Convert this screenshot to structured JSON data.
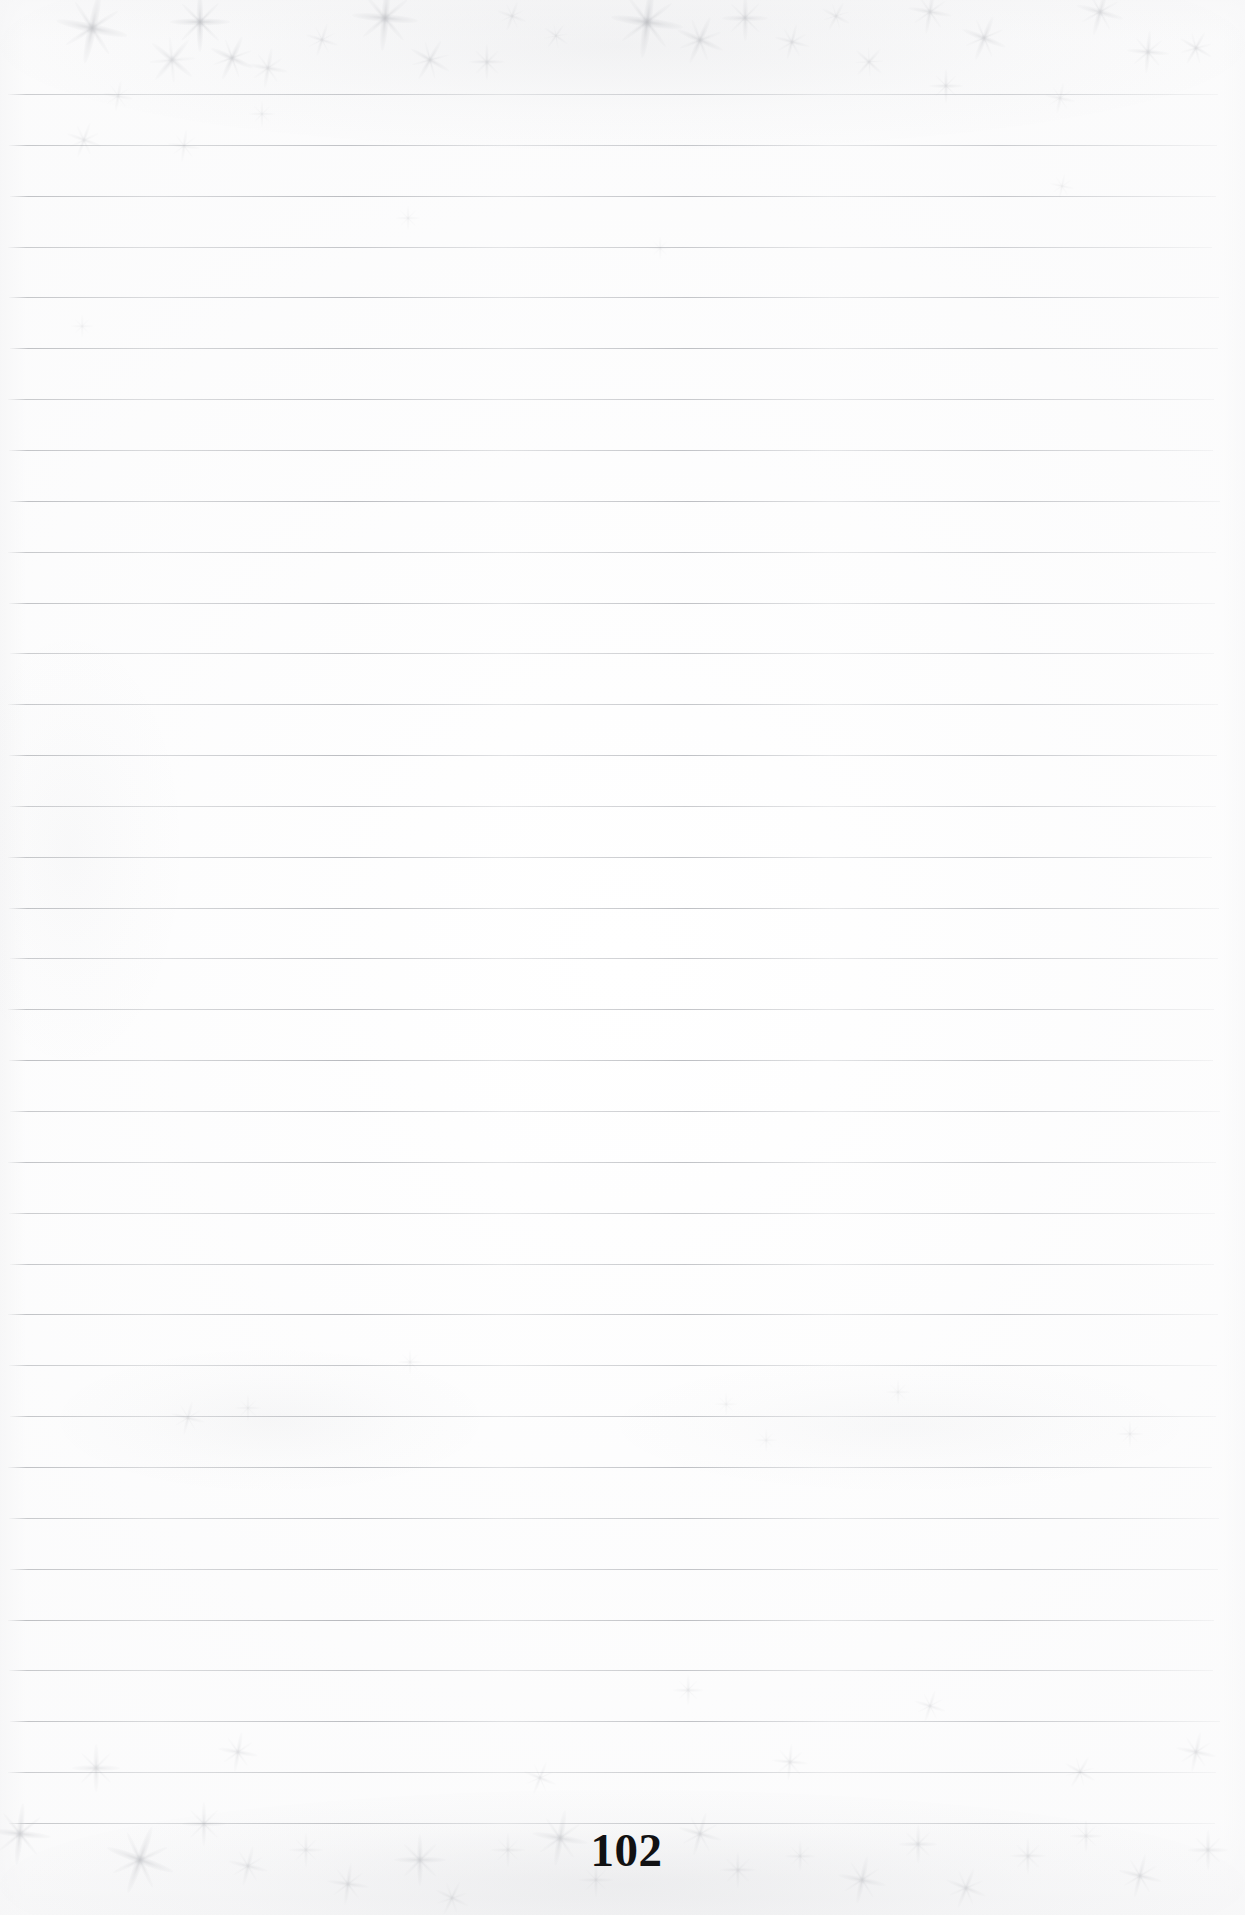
{
  "document": {
    "type": "lined-notebook-page",
    "page_number": "102",
    "content_text": "",
    "background_color": "#ffffff",
    "rule_line_color": "#b2b4b8",
    "page_number_color": "#111113"
  },
  "layout": {
    "width": 1245,
    "height": 1915,
    "rule_first_y": 94,
    "rule_spacing": 50.85,
    "rule_count": 35,
    "rule_left": 8,
    "rule_right": 1218,
    "page_number_baseline_y": 1868
  },
  "artifacts": {
    "description": "star-burst scan dust sparkles",
    "sparkles": [
      {
        "x": 92,
        "y": 28,
        "size": 72,
        "opacity": 0.5,
        "rotate": 12
      },
      {
        "x": 200,
        "y": 22,
        "size": 60,
        "opacity": 0.55,
        "rotate": 0
      },
      {
        "x": 232,
        "y": 58,
        "size": 46,
        "opacity": 0.4,
        "rotate": 25
      },
      {
        "x": 172,
        "y": 60,
        "size": 52,
        "opacity": 0.35,
        "rotate": 40
      },
      {
        "x": 268,
        "y": 68,
        "size": 40,
        "opacity": 0.3,
        "rotate": 10
      },
      {
        "x": 322,
        "y": 40,
        "size": 34,
        "opacity": 0.28,
        "rotate": 18
      },
      {
        "x": 385,
        "y": 18,
        "size": 66,
        "opacity": 0.5,
        "rotate": 5
      },
      {
        "x": 430,
        "y": 60,
        "size": 44,
        "opacity": 0.35,
        "rotate": 30
      },
      {
        "x": 487,
        "y": 62,
        "size": 36,
        "opacity": 0.3,
        "rotate": 0
      },
      {
        "x": 512,
        "y": 16,
        "size": 30,
        "opacity": 0.25,
        "rotate": 20
      },
      {
        "x": 556,
        "y": 36,
        "size": 28,
        "opacity": 0.24,
        "rotate": 35
      },
      {
        "x": 647,
        "y": 22,
        "size": 72,
        "opacity": 0.55,
        "rotate": 8
      },
      {
        "x": 700,
        "y": 40,
        "size": 50,
        "opacity": 0.4,
        "rotate": 24
      },
      {
        "x": 745,
        "y": 18,
        "size": 46,
        "opacity": 0.38,
        "rotate": 0
      },
      {
        "x": 792,
        "y": 42,
        "size": 36,
        "opacity": 0.3,
        "rotate": 15
      },
      {
        "x": 836,
        "y": 16,
        "size": 30,
        "opacity": 0.26,
        "rotate": 28
      },
      {
        "x": 869,
        "y": 62,
        "size": 34,
        "opacity": 0.28,
        "rotate": 42
      },
      {
        "x": 930,
        "y": 12,
        "size": 44,
        "opacity": 0.34,
        "rotate": 10
      },
      {
        "x": 946,
        "y": 86,
        "size": 34,
        "opacity": 0.3,
        "rotate": 0
      },
      {
        "x": 984,
        "y": 38,
        "size": 46,
        "opacity": 0.38,
        "rotate": 22
      },
      {
        "x": 1100,
        "y": 12,
        "size": 48,
        "opacity": 0.36,
        "rotate": 16
      },
      {
        "x": 1148,
        "y": 52,
        "size": 42,
        "opacity": 0.34,
        "rotate": 5
      },
      {
        "x": 1196,
        "y": 48,
        "size": 36,
        "opacity": 0.3,
        "rotate": 30
      },
      {
        "x": 1060,
        "y": 98,
        "size": 30,
        "opacity": 0.22,
        "rotate": 12
      },
      {
        "x": 118,
        "y": 96,
        "size": 30,
        "opacity": 0.22,
        "rotate": 10
      },
      {
        "x": 262,
        "y": 114,
        "size": 26,
        "opacity": 0.2,
        "rotate": 0
      },
      {
        "x": 84,
        "y": 140,
        "size": 36,
        "opacity": 0.26,
        "rotate": 20
      },
      {
        "x": 184,
        "y": 146,
        "size": 32,
        "opacity": 0.22,
        "rotate": 8
      },
      {
        "x": 408,
        "y": 218,
        "size": 24,
        "opacity": 0.18,
        "rotate": 0
      },
      {
        "x": 660,
        "y": 248,
        "size": 22,
        "opacity": 0.16,
        "rotate": 0
      },
      {
        "x": 1062,
        "y": 186,
        "size": 24,
        "opacity": 0.18,
        "rotate": 12
      },
      {
        "x": 82,
        "y": 326,
        "size": 22,
        "opacity": 0.16,
        "rotate": 0
      },
      {
        "x": 410,
        "y": 1362,
        "size": 24,
        "opacity": 0.18,
        "rotate": 0
      },
      {
        "x": 726,
        "y": 1404,
        "size": 22,
        "opacity": 0.16,
        "rotate": 0
      },
      {
        "x": 188,
        "y": 1418,
        "size": 34,
        "opacity": 0.26,
        "rotate": 14
      },
      {
        "x": 248,
        "y": 1408,
        "size": 26,
        "opacity": 0.2,
        "rotate": 0
      },
      {
        "x": 766,
        "y": 1440,
        "size": 22,
        "opacity": 0.16,
        "rotate": 0
      },
      {
        "x": 898,
        "y": 1392,
        "size": 24,
        "opacity": 0.18,
        "rotate": 0
      },
      {
        "x": 1130,
        "y": 1434,
        "size": 26,
        "opacity": 0.2,
        "rotate": 0
      },
      {
        "x": 688,
        "y": 1690,
        "size": 30,
        "opacity": 0.24,
        "rotate": 0
      },
      {
        "x": 930,
        "y": 1706,
        "size": 32,
        "opacity": 0.26,
        "rotate": 18
      },
      {
        "x": 238,
        "y": 1752,
        "size": 40,
        "opacity": 0.3,
        "rotate": 10
      },
      {
        "x": 96,
        "y": 1768,
        "size": 48,
        "opacity": 0.34,
        "rotate": 0
      },
      {
        "x": 540,
        "y": 1778,
        "size": 34,
        "opacity": 0.26,
        "rotate": 22
      },
      {
        "x": 790,
        "y": 1762,
        "size": 36,
        "opacity": 0.28,
        "rotate": 5
      },
      {
        "x": 1080,
        "y": 1772,
        "size": 34,
        "opacity": 0.26,
        "rotate": 30
      },
      {
        "x": 1196,
        "y": 1752,
        "size": 40,
        "opacity": 0.3,
        "rotate": 12
      },
      {
        "x": 20,
        "y": 1834,
        "size": 62,
        "opacity": 0.45,
        "rotate": 6
      },
      {
        "x": 140,
        "y": 1860,
        "size": 70,
        "opacity": 0.5,
        "rotate": 20
      },
      {
        "x": 204,
        "y": 1824,
        "size": 44,
        "opacity": 0.34,
        "rotate": 0
      },
      {
        "x": 248,
        "y": 1866,
        "size": 40,
        "opacity": 0.3,
        "rotate": 14
      },
      {
        "x": 306,
        "y": 1850,
        "size": 34,
        "opacity": 0.26,
        "rotate": 0
      },
      {
        "x": 348,
        "y": 1884,
        "size": 42,
        "opacity": 0.32,
        "rotate": 8
      },
      {
        "x": 420,
        "y": 1860,
        "size": 52,
        "opacity": 0.4,
        "rotate": 0
      },
      {
        "x": 452,
        "y": 1898,
        "size": 36,
        "opacity": 0.28,
        "rotate": 26
      },
      {
        "x": 508,
        "y": 1850,
        "size": 34,
        "opacity": 0.26,
        "rotate": 0
      },
      {
        "x": 560,
        "y": 1838,
        "size": 56,
        "opacity": 0.42,
        "rotate": 10
      },
      {
        "x": 596,
        "y": 1880,
        "size": 34,
        "opacity": 0.26,
        "rotate": 0
      },
      {
        "x": 700,
        "y": 1834,
        "size": 44,
        "opacity": 0.34,
        "rotate": 16
      },
      {
        "x": 738,
        "y": 1870,
        "size": 36,
        "opacity": 0.28,
        "rotate": 0
      },
      {
        "x": 800,
        "y": 1856,
        "size": 30,
        "opacity": 0.24,
        "rotate": 0
      },
      {
        "x": 862,
        "y": 1880,
        "size": 48,
        "opacity": 0.36,
        "rotate": 12
      },
      {
        "x": 918,
        "y": 1844,
        "size": 38,
        "opacity": 0.3,
        "rotate": 0
      },
      {
        "x": 966,
        "y": 1888,
        "size": 42,
        "opacity": 0.32,
        "rotate": 22
      },
      {
        "x": 1028,
        "y": 1856,
        "size": 36,
        "opacity": 0.28,
        "rotate": 0
      },
      {
        "x": 1086,
        "y": 1836,
        "size": 32,
        "opacity": 0.26,
        "rotate": 0
      },
      {
        "x": 1140,
        "y": 1876,
        "size": 44,
        "opacity": 0.34,
        "rotate": 14
      },
      {
        "x": 1208,
        "y": 1850,
        "size": 40,
        "opacity": 0.3,
        "rotate": 0
      }
    ],
    "hazes": [
      {
        "x": 0,
        "y": 1790,
        "w": 1245,
        "h": 190,
        "opacity": 0.9
      },
      {
        "x": 0,
        "y": -60,
        "w": 1245,
        "h": 210,
        "opacity": 0.7
      },
      {
        "x": 60,
        "y": 1350,
        "w": 420,
        "h": 140,
        "opacity": 0.45
      },
      {
        "x": 620,
        "y": 1360,
        "w": 560,
        "h": 130,
        "opacity": 0.38
      },
      {
        "x": -40,
        "y": 640,
        "w": 220,
        "h": 420,
        "opacity": 0.3
      }
    ]
  }
}
